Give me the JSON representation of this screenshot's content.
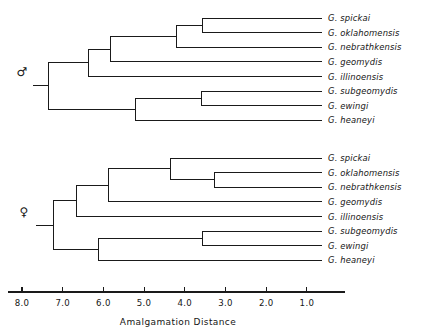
{
  "figure": {
    "width": 447,
    "height": 336,
    "background": "#ffffff",
    "ink_color": "#1a1a1a"
  },
  "axis": {
    "title": "Amalgamation  Distance",
    "tick_labels": [
      "8.0",
      "7.0",
      "6.0",
      "5.0",
      "4.0",
      "3.0",
      "2.0",
      "1.0"
    ],
    "tick_values": [
      8.0,
      7.0,
      6.0,
      5.0,
      4.0,
      3.0,
      2.0,
      1.0
    ],
    "direction": "reversed",
    "x_left_px": 8,
    "x_right_px": 345,
    "tick_start_px": 22,
    "tick_step_px": 40.7,
    "baseline_y_px": 292,
    "tick_length_px": 5,
    "label_y_px": 306,
    "title_x_px": 178,
    "title_y_px": 325
  },
  "panels": [
    {
      "id": "male-dendrogram",
      "sex_symbol": "♂",
      "sex_name": "male",
      "symbol_x_px": 22,
      "symbol_y_px": 76,
      "root_stub_x1_px": 33,
      "root_stub_x2_px": 48,
      "root_y_px": 72,
      "leaf_top_y_px": 18,
      "leaf_step_px": 14.6,
      "leaf_label_x_px": 328,
      "leaves": [
        {
          "name": "G. spickai",
          "index": 0
        },
        {
          "name": "G. oklahomensis",
          "index": 1
        },
        {
          "name": "G. nebrathkensis",
          "index": 2
        },
        {
          "name": "G. geomydis",
          "index": 3
        },
        {
          "name": "G. illinoensis",
          "index": 4
        },
        {
          "name": "G. subgeomydis",
          "index": 5
        },
        {
          "name": "G. ewingi",
          "index": 6
        },
        {
          "name": "G. heaneyi",
          "index": 7
        }
      ],
      "leaf_tip_x_px": 322,
      "merges": [
        {
          "id": "m1",
          "label": "spickai + oklahomensis",
          "x_px": 202,
          "children": [
            0,
            1
          ],
          "distance": 3.6
        },
        {
          "id": "m2",
          "label": "(spickai,oklahomensis) + nebrathkensis",
          "x_px": 176,
          "children": [
            "m1",
            2
          ],
          "distance": 4.2
        },
        {
          "id": "m3",
          "label": "subgeomydis + ewingi",
          "x_px": 201,
          "children": [
            5,
            6
          ],
          "distance": 3.3
        },
        {
          "id": "m4",
          "label": "(subgeomydis,ewingi) + heaneyi",
          "x_px": 135,
          "children": [
            "m3",
            7
          ],
          "distance": 5.2
        },
        {
          "id": "m5",
          "label": "upper clade + geomydis",
          "x_px": 110,
          "children": [
            "m2",
            3
          ],
          "distance": 5.7
        },
        {
          "id": "m6",
          "label": "upper clade + illinoensis",
          "x_px": 88,
          "children": [
            "m5",
            4
          ],
          "distance": 6.3
        },
        {
          "id": "m7",
          "label": "root",
          "x_px": 48,
          "children": [
            "m6",
            "m4"
          ],
          "distance": 7.3
        }
      ]
    },
    {
      "id": "female-dendrogram",
      "sex_symbol": "♀",
      "sex_name": "female",
      "symbol_x_px": 24,
      "symbol_y_px": 216,
      "root_stub_x1_px": 36,
      "root_stub_x2_px": 53,
      "root_y_px": 212,
      "leaf_top_y_px": 158,
      "leaf_step_px": 14.6,
      "leaf_label_x_px": 328,
      "leaves": [
        {
          "name": "G. spickai",
          "index": 0
        },
        {
          "name": "G. oklahomensis",
          "index": 1
        },
        {
          "name": "G. nebrathkensis",
          "index": 2
        },
        {
          "name": "G. geomydis",
          "index": 3
        },
        {
          "name": "G. illinoensis",
          "index": 4
        },
        {
          "name": "G. subgeomydis",
          "index": 5
        },
        {
          "name": "G. ewingi",
          "index": 6
        },
        {
          "name": "G. heaneyi",
          "index": 7
        }
      ],
      "leaf_tip_x_px": 322,
      "merges": [
        {
          "id": "f1",
          "label": "oklahomensis + nebrathkensis",
          "x_px": 214,
          "children": [
            1,
            2
          ],
          "distance": 3.2
        },
        {
          "id": "f2",
          "label": "spickai + (oklahomensis,nebrathkensis)",
          "x_px": 170,
          "children": [
            0,
            "f1"
          ],
          "distance": 4.3
        },
        {
          "id": "f3",
          "label": "subgeomydis + ewingi",
          "x_px": 202,
          "children": [
            5,
            6
          ],
          "distance": 3.5
        },
        {
          "id": "f4",
          "label": "(subgeomydis,ewingi) + heaneyi",
          "x_px": 98,
          "children": [
            "f3",
            7
          ],
          "distance": 6.1
        },
        {
          "id": "f5",
          "label": "upper clade + geomydis",
          "x_px": 108,
          "children": [
            "f2",
            3
          ],
          "distance": 5.8
        },
        {
          "id": "f6",
          "label": "upper clade + illinoensis",
          "x_px": 76,
          "children": [
            "f5",
            4
          ],
          "distance": 6.6
        },
        {
          "id": "f7",
          "label": "root",
          "x_px": 53,
          "children": [
            "f6",
            "f4"
          ],
          "distance": 7.2
        }
      ]
    }
  ],
  "chart_data": {
    "type": "dendrogram",
    "title": "",
    "xlabel": "Amalgamation  Distance",
    "ylabel": "",
    "xlim": [
      8.3,
      0.4
    ],
    "axis_reversed": true,
    "tick_values": [
      8.0,
      7.0,
      6.0,
      5.0,
      4.0,
      3.0,
      2.0,
      1.0
    ],
    "tick_labels": [
      "8.0",
      "7.0",
      "6.0",
      "5.0",
      "4.0",
      "3.0",
      "2.0",
      "1.0"
    ],
    "grid": false,
    "legend": "none",
    "panels": [
      {
        "name": "male",
        "symbol": "♂",
        "leaf_order": [
          "G. spickai",
          "G. oklahomensis",
          "G. nebrathkensis",
          "G. geomydis",
          "G. illinoensis",
          "G. subgeomydis",
          "G. ewingi",
          "G. heaneyi"
        ],
        "linkages": [
          {
            "cluster": [
              "G. spickai",
              "G. oklahomensis"
            ],
            "distance": 3.6
          },
          {
            "cluster": [
              "G. spickai",
              "G. oklahomensis",
              "G. nebrathkensis"
            ],
            "distance": 4.2
          },
          {
            "cluster": [
              "G. subgeomydis",
              "G. ewingi"
            ],
            "distance": 3.3
          },
          {
            "cluster": [
              "G. subgeomydis",
              "G. ewingi",
              "G. heaneyi"
            ],
            "distance": 5.2
          },
          {
            "cluster": [
              "G. spickai",
              "G. oklahomensis",
              "G. nebrathkensis",
              "G. geomydis"
            ],
            "distance": 5.7
          },
          {
            "cluster": [
              "G. spickai",
              "G. oklahomensis",
              "G. nebrathkensis",
              "G. geomydis",
              "G. illinoensis"
            ],
            "distance": 6.3
          },
          {
            "cluster": [
              "all"
            ],
            "distance": 7.3
          }
        ]
      },
      {
        "name": "female",
        "symbol": "♀",
        "leaf_order": [
          "G. spickai",
          "G. oklahomensis",
          "G. nebrathkensis",
          "G. geomydis",
          "G. illinoensis",
          "G. subgeomydis",
          "G. ewingi",
          "G. heaneyi"
        ],
        "linkages": [
          {
            "cluster": [
              "G. oklahomensis",
              "G. nebrathkensis"
            ],
            "distance": 3.2
          },
          {
            "cluster": [
              "G. spickai",
              "G. oklahomensis",
              "G. nebrathkensis"
            ],
            "distance": 4.3
          },
          {
            "cluster": [
              "G. subgeomydis",
              "G. ewingi"
            ],
            "distance": 3.5
          },
          {
            "cluster": [
              "G. spickai",
              "G. oklahomensis",
              "G. nebrathkensis",
              "G. geomydis"
            ],
            "distance": 5.8
          },
          {
            "cluster": [
              "G. subgeomydis",
              "G. ewingi",
              "G. heaneyi"
            ],
            "distance": 6.1
          },
          {
            "cluster": [
              "G. spickai",
              "G. oklahomensis",
              "G. nebrathkensis",
              "G. geomydis",
              "G. illinoensis"
            ],
            "distance": 6.6
          },
          {
            "cluster": [
              "all"
            ],
            "distance": 7.2
          }
        ]
      }
    ]
  }
}
